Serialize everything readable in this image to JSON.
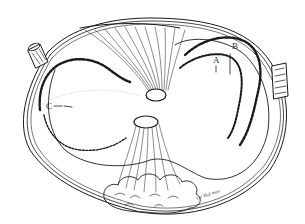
{
  "figure": {
    "type": "anatomical line drawing",
    "stroke_color": "#1a1a1a",
    "background_color": "#ffffff"
  },
  "labels": {
    "a": "A",
    "b": "B",
    "c": "C"
  },
  "signature": "Ge Hof man"
}
